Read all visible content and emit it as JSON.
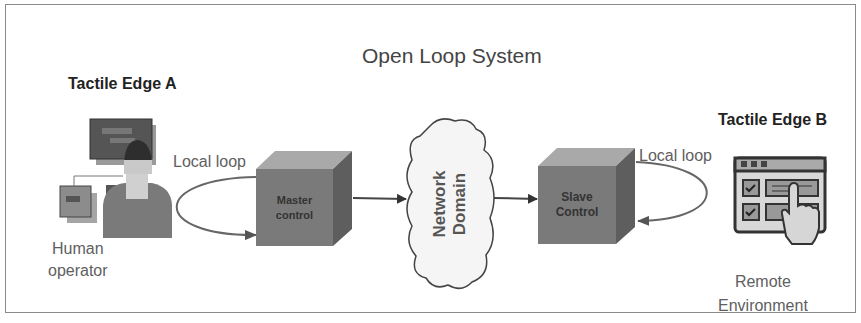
{
  "diagram": {
    "title": "Open Loop System",
    "edge_a": {
      "label": "Tactile Edge A",
      "actor_line1": "Human",
      "actor_line2": "operator",
      "loop_label": "Local loop",
      "icon": "human-operator-icon"
    },
    "master": {
      "line1": "Master",
      "line2": "control"
    },
    "network": {
      "line1": "Network",
      "line2": "Domain"
    },
    "slave": {
      "line1": "Slave",
      "line2": "Control"
    },
    "edge_b": {
      "label": "Tactile Edge B",
      "loop_label": "Local loop",
      "env_line1": "Remote",
      "env_line2": "Environment",
      "icon": "touch-interface-icon"
    },
    "colors": {
      "box_front": "#7a7a7a",
      "box_top": "#a9a9a9",
      "box_side": "#5e5e5e",
      "line": "#555555",
      "border": "#8a8a8a"
    }
  }
}
